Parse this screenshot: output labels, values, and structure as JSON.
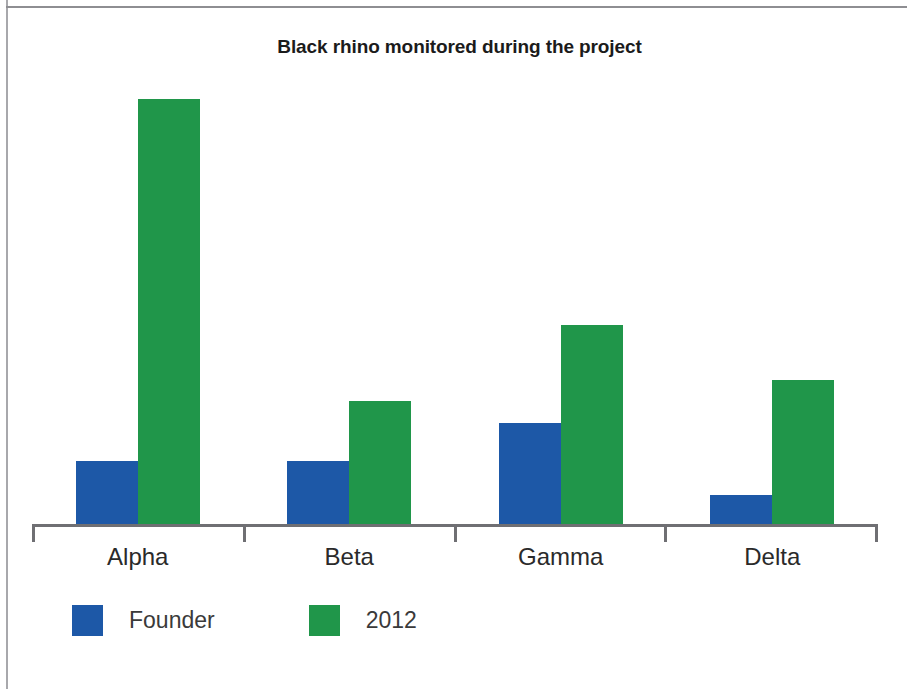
{
  "figure": {
    "title": "Black rhino monitored during the project"
  },
  "colors": {
    "founder_blue": "#1d58a7",
    "year_green": "#20964a",
    "axis": "#6f6f73",
    "title_text": "#1b1b1b",
    "label_text": "#2a2a2a",
    "page_rule": "#a8a8ac",
    "background": "#ffffff"
  },
  "legend": {
    "position": "bottom-left",
    "items": [
      {
        "label": "Founder",
        "color": "#1d58a7",
        "swatch": "legend-swatch-founder"
      },
      {
        "label": "2012",
        "color": "#20964a",
        "swatch": "legend-swatch-2012"
      }
    ]
  },
  "axis": {
    "categories": [
      "Alpha",
      "Beta",
      "Gamma",
      "Delta"
    ],
    "tick_count": 5,
    "y_axis_visible": false,
    "y_tick_labels": [],
    "grid": false
  },
  "chart_data": {
    "type": "bar",
    "title": "Black rhino monitored during the project",
    "subtitle": "",
    "xlabel": "",
    "ylabel": "",
    "categories": [
      "Alpha",
      "Beta",
      "Gamma",
      "Delta"
    ],
    "series": [
      {
        "name": "Founder",
        "color": "#1d58a7",
        "values": [
          15,
          15,
          24,
          7
        ]
      },
      {
        "name": "2012",
        "color": "#20964a",
        "values": [
          100,
          29,
          47,
          34
        ]
      }
    ],
    "ylim": [
      0,
      102
    ],
    "grid": false,
    "legend_position": "bottom-left"
  }
}
